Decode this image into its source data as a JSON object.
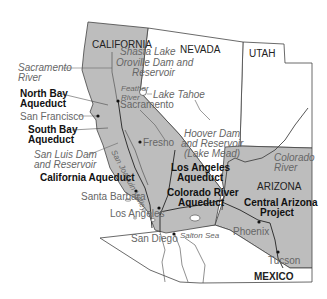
{
  "map": {
    "title": "Water projects of California and the Southwest",
    "colors": {
      "shaded_region": "#bdbdbd",
      "unshaded_region": "#ffffff",
      "border": "#444444",
      "river": "#555555",
      "aqueduct": "#333333"
    },
    "states": {
      "california": "CALIFORNIA",
      "nevada": "NEVADA",
      "utah": "UTAH",
      "arizona": "ARIZONA",
      "mexico": "MEXICO"
    },
    "water_features": {
      "shasta": "Shasta Lake",
      "oroville_1": "Oroville Dam and",
      "oroville_2": "Reservoir",
      "sacramento_river_1": "Sacramento",
      "sacramento_river_2": "River",
      "feather_river_1": "Feather",
      "feather_river_2": "River",
      "lake_tahoe": "Lake Tahoe",
      "san_luis_1": "San Luis Dam",
      "san_luis_2": "and Reservoir",
      "hoover_1": "Hoover Dam",
      "hoover_2": "and Reservoir",
      "hoover_3": "(Lake Mead)",
      "colorado_river_1": "Colorado",
      "colorado_river_2": "River",
      "san_joaquin_valley": "San Joaquin Valley",
      "salton_sea": "Salton Sea"
    },
    "aqueducts": {
      "north_bay_1": "North Bay",
      "north_bay_2": "Aqueduct",
      "south_bay_1": "South Bay",
      "south_bay_2": "Aqueduct",
      "california": "California Aqueduct",
      "los_angeles_1": "Los Angeles",
      "los_angeles_2": "Aqueduct",
      "colorado_river_1": "Colorado River",
      "colorado_river_2": "Aqueduct",
      "central_arizona_1": "Central Arizona",
      "central_arizona_2": "Project"
    },
    "cities": {
      "sacramento": "Sacramento",
      "san_francisco": "San Francisco",
      "fresno": "Fresno",
      "santa_barbara": "Santa Barbara",
      "los_angeles": "Los Angeles",
      "san_diego": "San Diego",
      "phoenix": "Phoenix",
      "tucson": "Tucson"
    }
  }
}
